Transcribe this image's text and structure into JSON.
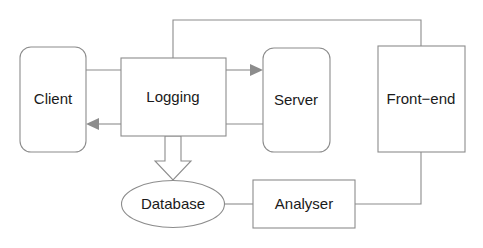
{
  "diagram": {
    "background_color": "#ffffff",
    "stroke_color": "#8c8c8c",
    "text_color": "#1a1a1a",
    "nodes": [
      {
        "id": "client",
        "label": "Client",
        "shape": "rounded-rect",
        "x": 20,
        "y": 47,
        "w": 66,
        "h": 105,
        "cx": 53,
        "cy": 99
      },
      {
        "id": "logging",
        "label": "Logging",
        "shape": "rect",
        "x": 121,
        "y": 58,
        "w": 105,
        "h": 78,
        "cx": 173,
        "cy": 97
      },
      {
        "id": "server",
        "label": "Server",
        "shape": "rounded-rect",
        "x": 263,
        "y": 48,
        "w": 67,
        "h": 104,
        "cx": 296,
        "cy": 100
      },
      {
        "id": "frontend",
        "label": "Front−end",
        "shape": "rect",
        "x": 378,
        "y": 46,
        "w": 87,
        "h": 106,
        "cx": 421,
        "cy": 99
      },
      {
        "id": "database",
        "label": "Database",
        "shape": "ellipse",
        "x": 122,
        "y": 181,
        "w": 103,
        "h": 47,
        "cx": 173,
        "cy": 204
      },
      {
        "id": "analyser",
        "label": "Analyser",
        "shape": "rect",
        "x": 253,
        "y": 180,
        "w": 102,
        "h": 48,
        "cx": 304,
        "cy": 204
      }
    ],
    "edges": [
      {
        "id": "client-to-logging",
        "from": "client",
        "to": "logging",
        "style": "solid",
        "arrow": "none"
      },
      {
        "id": "logging-to-server",
        "from": "logging",
        "to": "server",
        "style": "solid",
        "arrow": "filled-right"
      },
      {
        "id": "server-to-logging",
        "from": "server",
        "to": "logging",
        "style": "solid",
        "arrow": "none"
      },
      {
        "id": "logging-to-client",
        "from": "logging",
        "to": "client",
        "style": "solid",
        "arrow": "filled-left"
      },
      {
        "id": "logging-request-tap",
        "from": "logging",
        "to": "logging",
        "style": "dashed",
        "arrow": "none"
      },
      {
        "id": "logging-response-tap",
        "from": "logging",
        "to": "logging",
        "style": "dashed",
        "arrow": "none"
      },
      {
        "id": "logging-to-frontend",
        "from": "logging",
        "to": "frontend",
        "style": "solid",
        "arrow": "none"
      },
      {
        "id": "logging-to-database",
        "from": "logging",
        "to": "database",
        "style": "block",
        "arrow": "block-down"
      },
      {
        "id": "database-to-analyser",
        "from": "database",
        "to": "analyser",
        "style": "solid",
        "arrow": "none"
      },
      {
        "id": "analyser-to-frontend",
        "from": "analyser",
        "to": "frontend",
        "style": "solid",
        "arrow": "none"
      }
    ]
  }
}
